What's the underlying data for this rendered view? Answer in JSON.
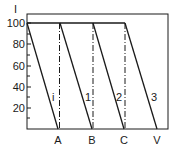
{
  "diagram": {
    "y_axis_label": "I",
    "y_ticks": [
      {
        "value": "100",
        "y": 23
      },
      {
        "value": "80",
        "y": 44
      },
      {
        "value": "60",
        "y": 66
      },
      {
        "value": "40",
        "y": 87
      },
      {
        "value": "20",
        "y": 108
      }
    ],
    "x_labels": [
      {
        "label": "A",
        "x": 58
      },
      {
        "label": "B",
        "x": 92
      },
      {
        "label": "C",
        "x": 124
      },
      {
        "label": "V",
        "x": 157
      }
    ],
    "line_labels": [
      {
        "label": "i",
        "x": 52,
        "y": 100
      },
      {
        "label": "1",
        "x": 85,
        "y": 100
      },
      {
        "label": "2",
        "x": 117,
        "y": 100
      },
      {
        "label": "3",
        "x": 151,
        "y": 100
      }
    ],
    "colors": {
      "line": "#1a1a1a",
      "background": "#ffffff"
    }
  }
}
